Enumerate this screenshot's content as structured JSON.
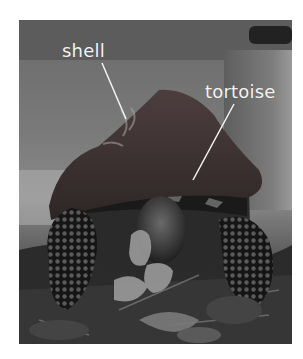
{
  "figure": {
    "labels": [
      {
        "text": "shell",
        "points_to": "carapace (top shell)"
      },
      {
        "text": "tortoise",
        "points_to": "tortoise head/body"
      }
    ],
    "colors": {
      "background": "#ffffff",
      "label_text": "#f4f4f4",
      "pointer_line": "#f4f4f4",
      "shell_tint": "#4a3a3a"
    }
  }
}
